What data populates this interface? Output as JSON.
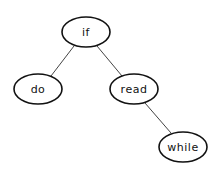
{
  "diagram": {
    "type": "binary-tree",
    "nodes": [
      {
        "id": "if",
        "label": "if",
        "cx": 86,
        "cy": 32,
        "rx": 24,
        "ry": 15
      },
      {
        "id": "do",
        "label": "do",
        "cx": 38,
        "cy": 89,
        "rx": 24,
        "ry": 15
      },
      {
        "id": "read",
        "label": "read",
        "cx": 134,
        "cy": 89,
        "rx": 24,
        "ry": 15
      },
      {
        "id": "while",
        "label": "while",
        "cx": 183,
        "cy": 147,
        "rx": 24,
        "ry": 15
      }
    ],
    "edges": [
      {
        "from": "if",
        "to": "do"
      },
      {
        "from": "if",
        "to": "read"
      },
      {
        "from": "read",
        "to": "while"
      }
    ]
  }
}
